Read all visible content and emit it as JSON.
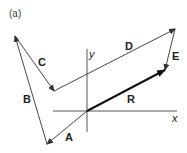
{
  "figure": {
    "caption": "(a)",
    "axes": {
      "x_label": "x",
      "y_label": "y"
    },
    "vectors": [
      {
        "name": "A",
        "label": "A"
      },
      {
        "name": "B",
        "label": "B"
      },
      {
        "name": "C",
        "label": "C"
      },
      {
        "name": "D",
        "label": "D"
      },
      {
        "name": "E",
        "label": "E"
      },
      {
        "name": "R",
        "label": "R",
        "resultant": true
      }
    ]
  },
  "colors": {
    "stroke": "#333333",
    "resultant": "#111111"
  }
}
